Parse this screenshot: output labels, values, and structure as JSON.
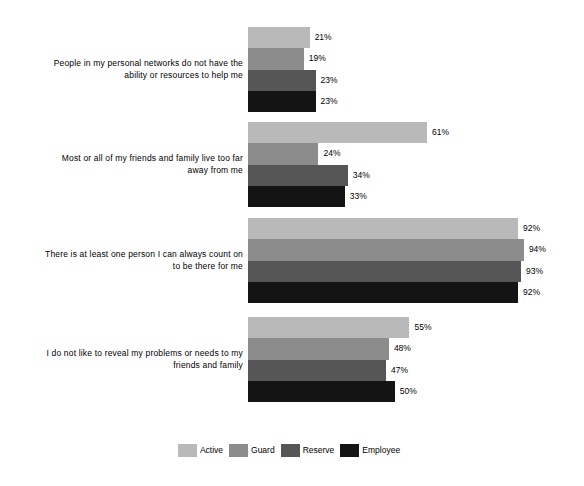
{
  "chart_data": {
    "type": "bar",
    "orientation": "horizontal",
    "title": "",
    "subtitle": "",
    "xlabel": "",
    "ylabel": "",
    "xlim": [
      0,
      100
    ],
    "grid": false,
    "value_suffix": "%",
    "legend_position": "bottom",
    "categories": [
      "People in my personal networks do not have the ability or resources to help me",
      "Most or all of my friends and family live too far away from me",
      "There is at least one person I can always count on to be there for me",
      "I do not like to reveal my problems or needs to my friends and family"
    ],
    "series": [
      {
        "name": "Active",
        "color": "#b9b9b9",
        "values": [
          21,
          61,
          92,
          55
        ]
      },
      {
        "name": "Guard",
        "color": "#8c8c8c",
        "values": [
          19,
          24,
          94,
          48
        ]
      },
      {
        "name": "Reserve",
        "color": "#565656",
        "values": [
          23,
          34,
          93,
          47
        ]
      },
      {
        "name": "Employee",
        "color": "#141414",
        "values": [
          23,
          33,
          92,
          50
        ]
      }
    ],
    "data_labels": [
      [
        "21%",
        "19%",
        "23%",
        "23%"
      ],
      [
        "61%",
        "24%",
        "34%",
        "33%"
      ],
      [
        "92%",
        "94%",
        "93%",
        "92%"
      ],
      [
        "55%",
        "48%",
        "47%",
        "50%"
      ]
    ],
    "category_label_lines": [
      [
        "People in my personal networks do not have the",
        "ability or resources to help me"
      ],
      [
        "Most or all of my friends and family live too far",
        "away from me"
      ],
      [
        "There is at least one person I can always count on",
        "to be there for me"
      ],
      [
        "I do not like to reveal my problems or needs to my",
        "friends and family"
      ]
    ]
  },
  "legend": {
    "items": [
      {
        "label": "Active",
        "color": "#b9b9b9"
      },
      {
        "label": "Guard",
        "color": "#8c8c8c"
      },
      {
        "label": "Reserve",
        "color": "#565656"
      },
      {
        "label": "Employee",
        "color": "#141414"
      }
    ]
  }
}
